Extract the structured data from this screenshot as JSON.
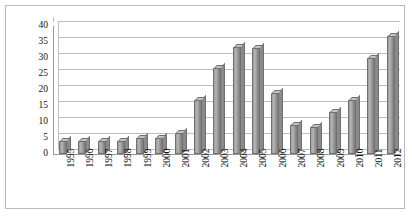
{
  "chart_data": {
    "type": "bar",
    "title": "",
    "subtitle": "",
    "xlabel": "",
    "ylabel": "",
    "categories": [
      "1995",
      "1996",
      "1997",
      "1998",
      "1999",
      "2000",
      "2001",
      "2002",
      "2003",
      "2004",
      "2005",
      "2006",
      "2007",
      "2008",
      "2009",
      "2010",
      "2011",
      "2012"
    ],
    "values": [
      4,
      4,
      4,
      4,
      5,
      5,
      6.5,
      17,
      27,
      33.5,
      33,
      19,
      9,
      8.5,
      13,
      17,
      30,
      37
    ],
    "series": [
      {
        "name": "",
        "values": [
          4,
          4,
          4,
          4,
          5,
          5,
          6.5,
          17,
          27,
          33.5,
          33,
          19,
          9,
          8.5,
          13,
          17,
          30,
          37
        ]
      }
    ],
    "ylim": [
      0,
      40
    ],
    "ytick_labels": [
      "0",
      "5",
      "10",
      "15",
      "20",
      "25",
      "30",
      "35",
      "40"
    ],
    "ytick_values": [
      0,
      5,
      10,
      15,
      20,
      25,
      30,
      35,
      40
    ],
    "ystep": 5,
    "grid": true,
    "gridlines": "horizontal",
    "legend": false,
    "legend_position": "none",
    "style": "3d-column",
    "bar_color": "#9e9e9e",
    "bar_edge_color": "#6f6f6f",
    "gridline_color": "#bdbdbd",
    "axis_color": "#9a9a9a",
    "background_color": "#ffffff",
    "border_color": "#b9b9b9",
    "annotations": []
  }
}
